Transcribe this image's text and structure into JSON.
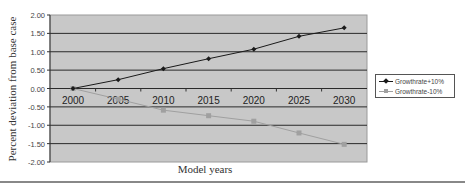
{
  "chart_data": {
    "type": "line",
    "title": "",
    "xlabel": "Model years",
    "ylabel": "Percent deviation from base case",
    "x": [
      "2000",
      "2005",
      "2010",
      "2015",
      "2020",
      "2025",
      "2030"
    ],
    "ylim": [
      -2.0,
      2.0
    ],
    "yticks": [
      "2.00",
      "1.50",
      "1.00",
      "0.50",
      "0.00",
      "-0.50",
      "-1.00",
      "-1.50",
      "-2.00"
    ],
    "grid": true,
    "legend_position": "right",
    "series": [
      {
        "name": "Growthrate+10%",
        "color": "#1a1a1a",
        "marker": "diamond",
        "values": [
          0.0,
          0.24,
          0.54,
          0.81,
          1.07,
          1.42,
          1.65
        ]
      },
      {
        "name": "Growthrate-10%",
        "color": "#a0a0a0",
        "marker": "square",
        "values": [
          0.0,
          -0.29,
          -0.59,
          -0.74,
          -0.89,
          -1.21,
          -1.52
        ]
      }
    ]
  },
  "labels": {
    "ylabel": "Percent deviation from base case",
    "xlabel": "Model years"
  },
  "legend": [
    {
      "label": "Growthrate+10%"
    },
    {
      "label": "Growthrate-10%"
    }
  ]
}
